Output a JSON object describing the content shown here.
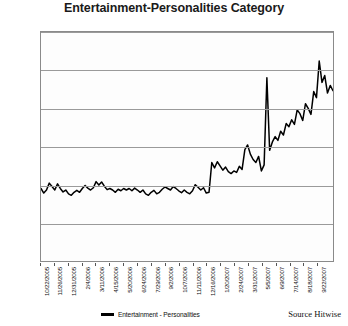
{
  "chart_data": {
    "type": "line",
    "title": "Entertainment-Personalities Category",
    "xlabel": "",
    "ylabel": "",
    "ylim": [
      0.0,
      0.3
    ],
    "yticks": [
      0.0,
      0.05,
      0.1,
      0.15,
      0.2,
      0.25,
      0.3
    ],
    "ytick_labels": [
      "0.0000%",
      "0.0500%",
      "0.1000%",
      "0.1500%",
      "0.2000%",
      "0.2500%",
      "0.3000%"
    ],
    "grid": true,
    "legend_position": "bottom-left",
    "legend": [
      "Entertainment - Personalities"
    ],
    "source": "Source Hitwise",
    "line_color": "#000000",
    "grid_color": "#9a9a9a",
    "xtick_labels": [
      "10/22/2005",
      "11/26/2005",
      "12/31/2005",
      "2/4/2006",
      "3/11/2006",
      "4/15/2006",
      "5/20/2006",
      "6/24/2006",
      "7/29/2006",
      "9/2/2006",
      "10/7/2006",
      "11/11/2006",
      "12/16/2006",
      "1/20/2007",
      "2/24/2007",
      "3/31/2007",
      "5/5/2007",
      "6/9/2007",
      "7/14/2007",
      "8/18/2007",
      "9/22/2007"
    ],
    "xtick_indices": [
      0,
      5,
      10,
      15,
      20,
      25,
      30,
      35,
      40,
      45,
      50,
      55,
      60,
      65,
      70,
      75,
      80,
      85,
      90,
      95,
      100
    ],
    "x_series_label": "week ending",
    "series": [
      {
        "name": "Entertainment - Personalities",
        "values": [
          0.095,
          0.089,
          0.093,
          0.102,
          0.0975,
          0.093,
          0.101,
          0.095,
          0.0905,
          0.093,
          0.088,
          0.086,
          0.09,
          0.0925,
          0.09,
          0.095,
          0.099,
          0.0955,
          0.093,
          0.096,
          0.104,
          0.0995,
          0.1035,
          0.098,
          0.0935,
          0.095,
          0.093,
          0.09,
          0.094,
          0.092,
          0.095,
          0.093,
          0.095,
          0.092,
          0.0955,
          0.093,
          0.09,
          0.093,
          0.088,
          0.086,
          0.09,
          0.0925,
          0.088,
          0.09,
          0.094,
          0.097,
          0.095,
          0.093,
          0.0975,
          0.095,
          0.092,
          0.0895,
          0.093,
          0.09,
          0.088,
          0.092,
          0.1,
          0.0965,
          0.093,
          0.096,
          0.089,
          0.09,
          0.129,
          0.122,
          0.13,
          0.1245,
          0.119,
          0.123,
          0.117,
          0.1145,
          0.118,
          0.116,
          0.124,
          0.12,
          0.146,
          0.152,
          0.14,
          0.133,
          0.129,
          0.137,
          0.118,
          0.126,
          0.24,
          0.145,
          0.156,
          0.163,
          0.158,
          0.17,
          0.165,
          0.18,
          0.176,
          0.185,
          0.179,
          0.198,
          0.193,
          0.184,
          0.206,
          0.2,
          0.192,
          0.222,
          0.214,
          0.262,
          0.234,
          0.243,
          0.22,
          0.23,
          0.223
        ]
      }
    ]
  }
}
